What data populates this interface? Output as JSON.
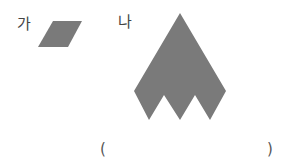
{
  "question": {
    "label_a": "가",
    "label_b": "나",
    "answer_open": "(",
    "answer_close": ")",
    "answer_value": ""
  },
  "colors": {
    "shape_fill": "#7a7a7a",
    "text": "#444444"
  }
}
